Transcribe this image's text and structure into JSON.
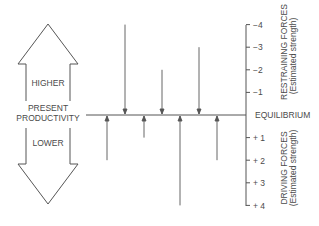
{
  "diagram": {
    "type": "force-field-analysis",
    "big_arrow": {
      "top_label": "HIGHER",
      "middle_label_line1": "PRESENT",
      "middle_label_line2": "PRODUCTIVITY",
      "bottom_label": "LOWER"
    },
    "equilibrium_label": "EQUILIBRIUM",
    "scale": {
      "restraining_ticks": [
        "−4",
        "−3",
        "−2",
        "−1"
      ],
      "driving_ticks": [
        "+ 1",
        "+ 2",
        "+ 3",
        "+ 4"
      ]
    },
    "restraining_label_line1": "RESTRAINING FORCES",
    "restraining_label_line2": "(Estimated strength)",
    "driving_label_line1": "DRIVING FORCES",
    "driving_label_line2": "(Estimated strength)",
    "restraining_forces": [
      {
        "x": 125,
        "strength": 4
      },
      {
        "x": 162,
        "strength": 2
      },
      {
        "x": 199,
        "strength": 3
      }
    ],
    "driving_forces": [
      {
        "x": 107,
        "strength": 2
      },
      {
        "x": 144,
        "strength": 1
      },
      {
        "x": 180,
        "strength": 4
      },
      {
        "x": 217,
        "strength": 2
      }
    ],
    "line_color": "#555555"
  }
}
